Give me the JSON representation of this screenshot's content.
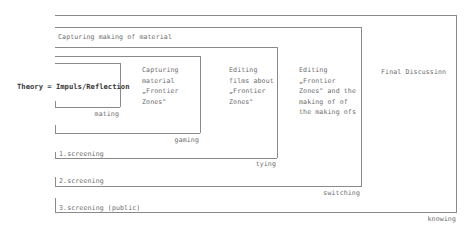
{
  "diagram": {
    "theory": "Theory = Impuls/Reflection",
    "header_band": "Capturing  making of material",
    "phases": [
      {
        "id": "capturing",
        "text": "Capturing\nmaterial\n„Frontier\nZones\""
      },
      {
        "id": "editing-films",
        "text": "Editing\nfilms about\n„Frontier\nZones\""
      },
      {
        "id": "editing-frontier",
        "text": "Editing\n„Frontier\nZones\" and the\nmaking of of\nthe making ofs"
      },
      {
        "id": "final",
        "text": "Final Discussion"
      }
    ],
    "box_labels": {
      "mating": "mating",
      "gaming": "gaming",
      "tying": "tying",
      "switching": "switching",
      "knowing": "knowing"
    },
    "screenings": [
      "1.screening",
      "2.screening",
      "3.screening (public)"
    ],
    "colors": {
      "line": "#8a8a8a",
      "text": "#6e6e6e",
      "theory_text": "#3a3a3a",
      "background": "#ffffff"
    }
  }
}
